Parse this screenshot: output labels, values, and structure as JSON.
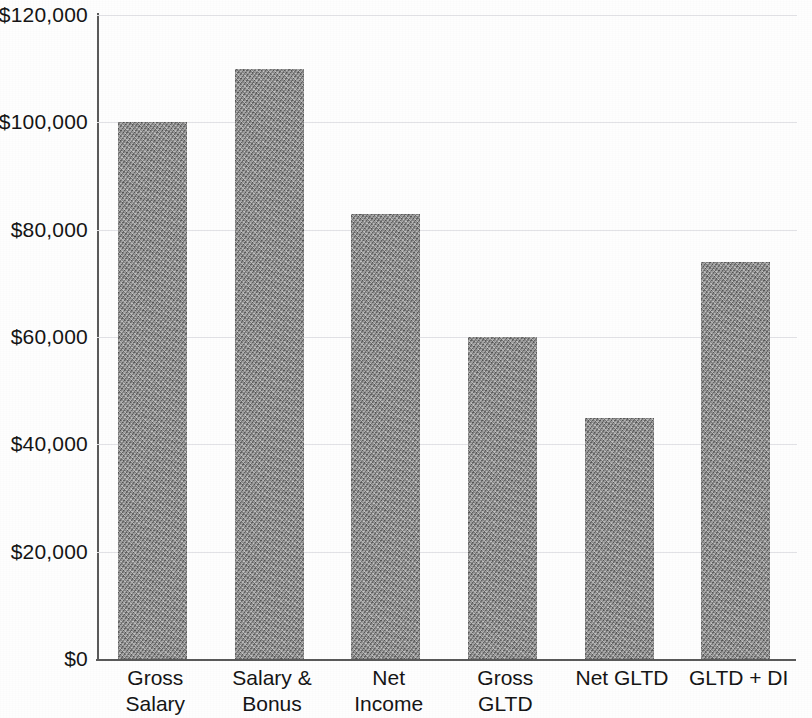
{
  "chart_data": {
    "type": "bar",
    "title": "",
    "subtitle": "",
    "xlabel": "",
    "ylabel": "",
    "categories": [
      "Gross Salary",
      "Salary & Bonus",
      "Net Income",
      "Gross GLTD",
      "Net GLTD",
      "GLTD + DI"
    ],
    "category_lines": [
      [
        "Gross",
        "Salary"
      ],
      [
        "Salary &",
        "Bonus"
      ],
      [
        "Net",
        "Income"
      ],
      [
        "Gross",
        "GLTD"
      ],
      [
        "Net GLTD"
      ],
      [
        "GLTD + DI"
      ]
    ],
    "values": [
      100000,
      110000,
      83000,
      60000,
      45000,
      74000
    ],
    "ylim": [
      0,
      120000
    ],
    "ytick_values": [
      0,
      20000,
      40000,
      60000,
      80000,
      100000,
      120000
    ],
    "ytick_labels": [
      "$0",
      "$20,000",
      "$40,000",
      "$60,000",
      "$80,000",
      "$100,000",
      "$120,000"
    ],
    "grid": true,
    "grid_axis": "y",
    "legend": false,
    "legend_position": "none",
    "bar_color": "#8e8e8e",
    "axis_color": "#5a5a5a",
    "gridline_color": "#e2e2e6",
    "text_color": "#151515",
    "background_color": "#ffffff",
    "series": [
      {
        "name": "Amount",
        "values": [
          100000,
          110000,
          83000,
          60000,
          45000,
          74000
        ]
      }
    ]
  }
}
